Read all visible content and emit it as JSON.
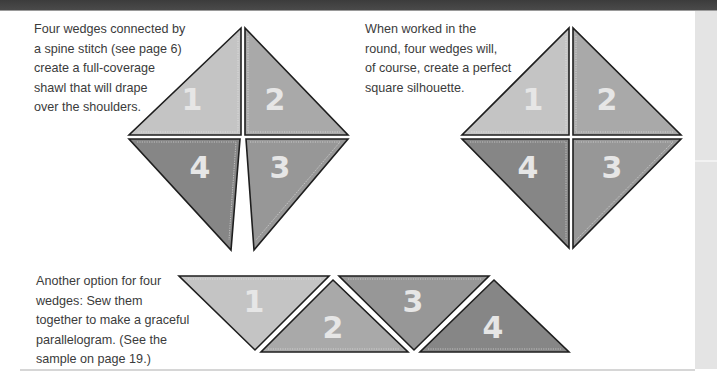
{
  "captions": {
    "left": {
      "lines": [
        "Four wedges connected by",
        "a spine stitch (see page 6)",
        "create a full-coverage",
        "shawl that will drape",
        "over the shoulders."
      ]
    },
    "right": {
      "lines": [
        "When worked in the",
        "round, four wedges will,",
        "of course, create a perfect",
        "square silhouette."
      ]
    },
    "bottom": {
      "lines": [
        "Another option for four",
        "wedges: Sew them",
        "together to make a graceful",
        "parallelogram. (See the",
        "sample on page 19.)"
      ]
    }
  },
  "figures": {
    "shawl_diamond": {
      "wedges": [
        {
          "label": "1"
        },
        {
          "label": "2"
        },
        {
          "label": "3"
        },
        {
          "label": "4"
        }
      ]
    },
    "square": {
      "wedges": [
        {
          "label": "1"
        },
        {
          "label": "2"
        },
        {
          "label": "3"
        },
        {
          "label": "4"
        }
      ]
    },
    "parallelogram": {
      "wedges": [
        {
          "label": "1"
        },
        {
          "label": "2"
        },
        {
          "label": "3"
        },
        {
          "label": "4"
        }
      ]
    }
  },
  "colors": {
    "wedge_1": "#c4c4c4",
    "wedge_2": "#a9a9a9",
    "wedge_3": "#979797",
    "wedge_4": "#868686",
    "outline": "#1e1e1e",
    "number": "#e6e6e6",
    "topbar": "#444444",
    "side_strip": "#e4e4e4"
  }
}
